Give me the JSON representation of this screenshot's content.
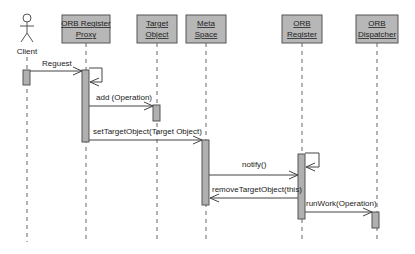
{
  "diagram": {
    "type": "sequence",
    "actor": {
      "label": "Client"
    },
    "objects": [
      {
        "line1": "ORB Register",
        "line2": "Proxy"
      },
      {
        "line1": "Target",
        "line2": "Object"
      },
      {
        "line1": "Meta",
        "line2": "Space"
      },
      {
        "line1": "ORB",
        "line2": "Register"
      },
      {
        "line1": "ORB",
        "line2": "Dispatcher"
      }
    ],
    "messages": [
      {
        "label": "Reguest",
        "from": "Client",
        "to": "ORB Register Proxy"
      },
      {
        "label": "add (Operation)",
        "from": "ORB Register Proxy",
        "to": "Target Object"
      },
      {
        "label": "setTargetObject(Target Object)",
        "from": "ORB Register Proxy",
        "to": "Meta Space"
      },
      {
        "label": "notify()",
        "from": "Meta Space",
        "to": "ORB Register"
      },
      {
        "label": "removeTargetObject(this)",
        "from": "ORB Register",
        "to": "Meta Space"
      },
      {
        "label": "runWork(Operation)",
        "from": "ORB Register",
        "to": "ORB Dispatcher"
      }
    ]
  }
}
